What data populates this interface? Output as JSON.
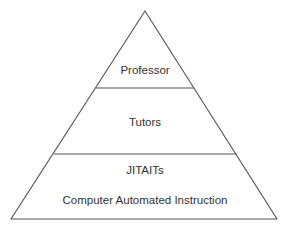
{
  "diagram": {
    "type": "pyramid",
    "colors": {
      "stroke": "#555555",
      "text": "#333333",
      "background": "#ffffff"
    },
    "levels": [
      {
        "id": "top",
        "labels": [
          "Professor"
        ]
      },
      {
        "id": "middle",
        "labels": [
          "Tutors"
        ]
      },
      {
        "id": "bottom",
        "labels": [
          "JITAITs",
          "Computer Automated Instruction"
        ]
      }
    ]
  }
}
